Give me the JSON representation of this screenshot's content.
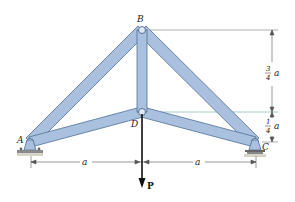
{
  "diagram": {
    "type": "truss",
    "joints": {
      "A": {
        "label": "A",
        "x": 30,
        "y": 142
      },
      "B": {
        "label": "B",
        "x": 142,
        "y": 30
      },
      "C": {
        "label": "C",
        "x": 255,
        "y": 142
      },
      "D": {
        "label": "D",
        "x": 142,
        "y": 112
      }
    },
    "members": [
      [
        "A",
        "B"
      ],
      [
        "B",
        "C"
      ],
      [
        "A",
        "D"
      ],
      [
        "D",
        "C"
      ],
      [
        "B",
        "D"
      ]
    ],
    "load": {
      "label": "P",
      "at": "D",
      "direction": "down"
    },
    "dimensions": {
      "left_span": "a",
      "right_span": "a",
      "upper_height_num": "3",
      "upper_height_den": "4",
      "upper_height_var": "a",
      "lower_height_num": "1",
      "lower_height_den": "4",
      "lower_height_var": "a"
    },
    "colors": {
      "member_fill": "#a9c1de",
      "member_stroke": "#4e6f96",
      "dimension_line": "#555555",
      "load_arrow": "#111111"
    }
  }
}
